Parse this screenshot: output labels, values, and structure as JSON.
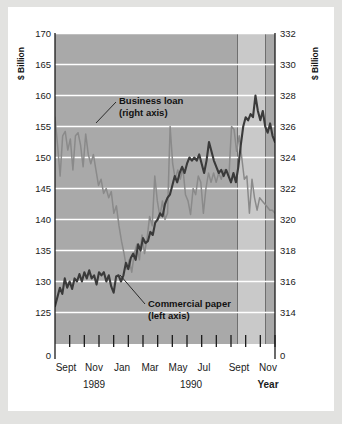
{
  "figure": {
    "background_color": "#e2e2e0",
    "card_color": "#ffffff",
    "plot_background_color": "#a9a9a9",
    "plot_band_color": "#c9c9c9",
    "gridline_color": "#ffffff",
    "axis_color": "#1b1b1b"
  },
  "chart_data": {
    "type": "line",
    "title": "",
    "subtitle": "",
    "xlabel": "Year",
    "ylabel": "$ Billion",
    "ylabel_right": "$ Billion",
    "grid": true,
    "legend_position": "inline-annotations",
    "x": [
      "Sept 1989",
      "Oct 1989",
      "Nov 1989",
      "Dec 1989",
      "Jan 1990",
      "Feb 1990",
      "Mar 1990",
      "Apr 1990",
      "May 1990",
      "Jun 1990",
      "Jul 1990",
      "Aug 1990",
      "Sept 1990",
      "Oct 1990",
      "Nov 1990",
      "Dec 1990"
    ],
    "x_tick_labels": [
      "Sept",
      "Nov",
      "Jan",
      "Mar",
      "May",
      "Jul",
      "Sept",
      "Nov"
    ],
    "x_group_labels": [
      "1989",
      "1990",
      "Year"
    ],
    "y_left_ticks": [
      170,
      165,
      160,
      155,
      150,
      145,
      140,
      135,
      130,
      125,
      0
    ],
    "y_right_ticks": [
      332,
      330,
      328,
      326,
      324,
      322,
      320,
      318,
      316,
      314,
      0
    ],
    "ylim_left": [
      123.5,
      170
    ],
    "ylim_right": [
      313.4,
      332
    ],
    "series": [
      {
        "name": "Business loan",
        "axis": "right",
        "axis_note": "(right axis)",
        "color": "#8a8a8a",
        "values_left_scale": [
          156.5,
          152.0,
          147.0,
          153.5,
          154.2,
          151.2,
          153.0,
          148.0,
          153.5,
          154.0,
          152.0,
          148.5,
          153.8,
          150.5,
          149.0,
          150.5,
          148.0,
          145.5,
          146.5,
          144.2,
          145.0,
          143.5,
          144.5,
          141.0,
          142.2,
          139.0,
          136.5,
          134.5,
          132.0,
          133.5,
          131.5,
          134.5,
          136.0,
          133.5,
          137.5,
          134.5,
          137.0,
          140.5,
          139.0,
          147.0,
          143.0,
          140.5,
          143.0,
          140.0,
          141.0,
          155.0,
          149.0,
          146.5,
          148.0,
          146.5,
          148.3,
          144.0,
          143.0,
          140.8,
          145.0,
          144.0,
          147.0,
          146.0,
          141.0,
          145.0,
          147.5,
          146.0,
          147.5,
          146.0,
          147.5,
          146.5,
          148.0,
          148.0,
          147.0,
          155.0,
          154.5,
          151.0,
          153.5,
          150.0,
          146.5,
          147.0,
          141.0,
          146.5,
          143.5,
          141.5,
          143.5,
          143.0,
          142.5,
          142.0,
          141.5,
          141.5,
          141.0
        ],
        "values_right_scale": [
          326.6,
          324.8,
          322.8,
          325.4,
          325.7,
          324.5,
          325.2,
          323.2,
          325.4,
          325.6,
          324.8,
          323.4,
          325.5,
          324.2,
          323.6,
          324.2,
          323.2,
          322.2,
          322.6,
          321.7,
          322.0,
          321.4,
          321.8,
          320.4,
          320.9,
          319.6,
          318.6,
          317.8,
          316.8,
          317.4,
          316.6,
          317.8,
          318.4,
          317.4,
          318.8,
          317.8,
          318.6,
          320.0,
          319.6,
          322.8,
          321.2,
          320.2,
          321.2,
          320.0,
          320.4,
          326.0,
          324.2,
          323.2,
          323.8,
          323.2,
          323.9,
          322.2,
          321.8,
          321.0,
          322.6,
          322.2,
          323.4,
          323.0,
          320.4,
          322.6,
          323.6,
          323.0,
          323.6,
          323.0,
          323.6,
          323.2,
          323.8,
          323.8,
          323.4,
          326.0,
          325.8,
          324.4,
          325.4,
          324.0,
          322.6,
          322.8,
          320.4,
          322.6,
          321.4,
          320.6,
          321.4,
          321.2,
          321.0,
          320.8,
          320.6,
          320.6,
          320.4
        ]
      },
      {
        "name": "Commercial paper",
        "axis": "left",
        "axis_note": "(left axis)",
        "color": "#3a3a3a",
        "values_left_scale": [
          126.0,
          127.5,
          129.0,
          128.0,
          130.5,
          129.0,
          130.0,
          128.8,
          130.5,
          130.0,
          131.2,
          130.0,
          131.5,
          130.5,
          131.8,
          130.5,
          131.0,
          129.5,
          131.5,
          131.0,
          131.5,
          130.0,
          131.0,
          129.2,
          128.2,
          130.8,
          131.0,
          130.0,
          131.0,
          133.0,
          132.0,
          133.8,
          134.5,
          133.5,
          136.0,
          135.0,
          137.0,
          136.2,
          136.5,
          138.0,
          137.5,
          139.5,
          140.0,
          141.0,
          140.5,
          142.5,
          143.5,
          144.0,
          145.5,
          147.0,
          146.0,
          147.5,
          148.5,
          147.5,
          149.0,
          150.0,
          149.5,
          150.0,
          149.5,
          150.5,
          149.0,
          147.5,
          149.5,
          152.5,
          151.0,
          149.5,
          148.5,
          147.5,
          148.0,
          147.0,
          148.0,
          147.0,
          146.0,
          147.5,
          146.0,
          148.5,
          152.0,
          155.0,
          156.5,
          156.0,
          157.0,
          156.5,
          160.0,
          157.5,
          156.0,
          157.5,
          155.0,
          154.0,
          155.5,
          153.5,
          152.5
        ]
      }
    ],
    "annotations": [
      {
        "id": "business-loan-annotation",
        "line1": "Business loan",
        "line2": "(right axis)"
      },
      {
        "id": "commercial-paper-annotation",
        "line1": "Commercial paper",
        "line2": "(left axis)"
      }
    ],
    "shaded_band": {
      "present": true,
      "color": "#c9c9c9",
      "note": ""
    }
  }
}
